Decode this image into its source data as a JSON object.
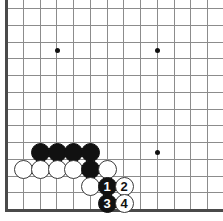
{
  "diagram": {
    "type": "go-board-diagram",
    "title": "",
    "board": {
      "cell_size": 16.75,
      "origin_x": 6,
      "origin_y": 8,
      "columns": 13,
      "rows": 13,
      "edges_shown": [
        "left",
        "bottom"
      ],
      "line_color": "#8c8c8c",
      "edge_color": "#4a4a4a",
      "background_color": "#ffffff"
    },
    "star_points": [
      {
        "name": "star-point-upper-left",
        "x": 57,
        "y": 50
      },
      {
        "name": "star-point-upper-right",
        "x": 157,
        "y": 50
      },
      {
        "name": "star-point-lower-right",
        "x": 157,
        "y": 152
      }
    ],
    "stones": [
      {
        "name": "stone-black-a",
        "color": "black",
        "label": "",
        "x": 40,
        "y": 152
      },
      {
        "name": "stone-black-b",
        "color": "black",
        "label": "",
        "x": 57,
        "y": 152
      },
      {
        "name": "stone-black-c",
        "color": "black",
        "label": "",
        "x": 73,
        "y": 152
      },
      {
        "name": "stone-black-d",
        "color": "black",
        "label": "",
        "x": 90,
        "y": 152
      },
      {
        "name": "stone-white-a",
        "color": "white",
        "label": "",
        "x": 23,
        "y": 169
      },
      {
        "name": "stone-white-b",
        "color": "white",
        "label": "",
        "x": 40,
        "y": 169
      },
      {
        "name": "stone-white-c",
        "color": "white",
        "label": "",
        "x": 57,
        "y": 169
      },
      {
        "name": "stone-white-d",
        "color": "white",
        "label": "",
        "x": 73,
        "y": 169
      },
      {
        "name": "stone-black-e",
        "color": "black",
        "label": "",
        "x": 90,
        "y": 169
      },
      {
        "name": "stone-white-e",
        "color": "white",
        "label": "",
        "x": 107,
        "y": 169
      },
      {
        "name": "stone-white-f",
        "color": "white",
        "label": "",
        "x": 90,
        "y": 186
      },
      {
        "name": "stone-move-1",
        "color": "black",
        "label": "1",
        "x": 107,
        "y": 186
      },
      {
        "name": "stone-move-2",
        "color": "white",
        "label": "2",
        "x": 124,
        "y": 186
      },
      {
        "name": "stone-move-3",
        "color": "black",
        "label": "3",
        "x": 107,
        "y": 203
      },
      {
        "name": "stone-move-4",
        "color": "white",
        "label": "4",
        "x": 124,
        "y": 203
      }
    ],
    "colors": {
      "black_stone": "#111111",
      "white_stone": "#ffffff",
      "white_stone_border": "#3a3a3a",
      "grid": "#8c8c8c",
      "edge": "#4a4a4a"
    }
  }
}
